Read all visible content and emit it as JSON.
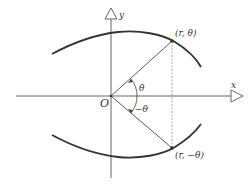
{
  "diagram": {
    "axes": {
      "x_label": "x",
      "y_label": "y",
      "origin_label": "O"
    },
    "points": [
      {
        "id": "upper",
        "label": "(r, θ)",
        "x": 172,
        "y": 41
      },
      {
        "id": "lower",
        "label": "(r, −θ)",
        "x": 172,
        "y": 148
      }
    ],
    "angles": {
      "upper_label": "θ",
      "lower_label": "−θ"
    },
    "colors": {
      "curve": "#333333",
      "axis": "#555555",
      "ray": "#444444",
      "dashed": "#888888",
      "background": "#ffffff"
    }
  }
}
